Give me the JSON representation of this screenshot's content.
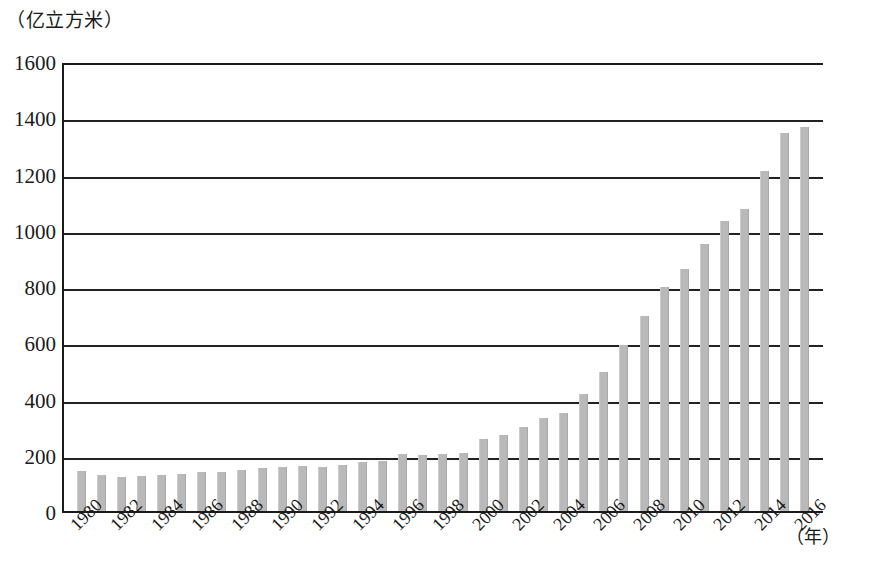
{
  "chart_data": {
    "type": "bar",
    "title": "",
    "subtitle": "",
    "unit_caption": "（亿立方米）",
    "ylabel": "亿立方米",
    "xlabel": "（年）",
    "ylim": [
      0,
      1600
    ],
    "ytick_step": 200,
    "ytick_labels": [
      "0",
      "200",
      "400",
      "600",
      "800",
      "1000",
      "1200",
      "1400",
      "1600"
    ],
    "ytick_values": [
      0,
      200,
      400,
      600,
      800,
      1000,
      1200,
      1400,
      1600
    ],
    "grid": true,
    "grid_axis": "y",
    "legend": null,
    "bar_color": "#b9b9b9",
    "axis_color": "#1a1a1a",
    "xtick_rotation": -45,
    "xtick_labels": [
      "1980",
      "1982",
      "1984",
      "1986",
      "1988",
      "1990",
      "1992",
      "1994",
      "1996",
      "1998",
      "2000",
      "2002",
      "2004",
      "2006",
      "2008",
      "2010",
      "2012",
      "2014",
      "2016"
    ],
    "categories": [
      "1980",
      "1981",
      "1982",
      "1983",
      "1984",
      "1985",
      "1986",
      "1987",
      "1988",
      "1989",
      "1990",
      "1991",
      "1992",
      "1993",
      "1994",
      "1995",
      "1996",
      "1997",
      "1998",
      "1999",
      "2000",
      "2001",
      "2002",
      "2003",
      "2004",
      "2005",
      "2006",
      "2007",
      "2008",
      "2009",
      "2010",
      "2011",
      "2012",
      "2013",
      "2014",
      "2015",
      "2016"
    ],
    "values": [
      143,
      127,
      122,
      124,
      127,
      133,
      139,
      140,
      145,
      153,
      157,
      160,
      158,
      162,
      176,
      179,
      201,
      198,
      203,
      206,
      255,
      272,
      297,
      330,
      350,
      415,
      495,
      590,
      695,
      795,
      860,
      950,
      1030,
      1075,
      1210,
      1345,
      1365
    ]
  }
}
